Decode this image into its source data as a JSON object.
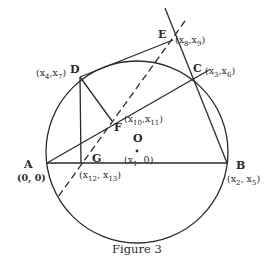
{
  "figure": {
    "caption": "Figure 3",
    "circle": {
      "cx": 137,
      "cy": 152,
      "r": 91
    },
    "stroke_color": "#2a2a2a",
    "points": {
      "A": {
        "label": "A",
        "coord": "(0, 0)",
        "x": 47,
        "y": 163
      },
      "B": {
        "label": "B",
        "coord_parts": [
          "x",
          "2",
          "x",
          "5"
        ],
        "x": 227,
        "y": 163
      },
      "C": {
        "label": "C",
        "coord_parts": [
          "x",
          "3",
          "x",
          "6"
        ],
        "x": 209,
        "y": 70
      },
      "D": {
        "label": "D",
        "coord_parts": [
          "x",
          "4",
          "x",
          "7"
        ],
        "x": 80,
        "y": 77
      },
      "E": {
        "label": "E",
        "coord_parts": [
          "x",
          "8",
          "x",
          "9"
        ],
        "x": 173,
        "y": 40
      },
      "F": {
        "label": "F",
        "coord_parts": [
          "x",
          "10",
          "x",
          "11"
        ],
        "x": 112,
        "y": 121
      },
      "G": {
        "label": "G",
        "coord_parts": [
          "x",
          "12",
          "x",
          "13"
        ],
        "x": 81,
        "y": 163
      },
      "O": {
        "label": "O",
        "coord_parts": [
          "x",
          "1",
          "0"
        ],
        "x": 137,
        "y": 150
      }
    },
    "text": {
      "A_label": "A",
      "A_coord": "(0, 0)",
      "B_label": "B",
      "C_label": "C",
      "D_label": "D",
      "E_label": "E",
      "F_label": "F",
      "G_label": "G",
      "O_label": "O",
      "x": "x",
      "sub_1": "1",
      "sub_2": "2",
      "sub_3": "3",
      "sub_4": "4",
      "sub_5": "5",
      "sub_6": "6",
      "sub_7": "7",
      "sub_8": "8",
      "sub_9": "9",
      "sub_10": "10",
      "sub_11": "11",
      "sub_12": "12",
      "sub_13": "13",
      "zero": "0"
    }
  }
}
